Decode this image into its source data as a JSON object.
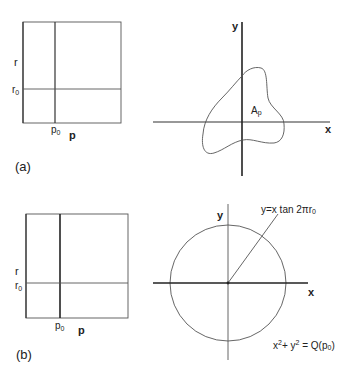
{
  "panel_a": {
    "caption": "(a)",
    "left_plot": {
      "y_label": "r",
      "y_marker": "r",
      "y_marker_sub": "0",
      "x_label": "p",
      "x_marker": "p",
      "x_marker_sub": "0"
    },
    "right_plot": {
      "x_axis_label": "x",
      "y_axis_label": "y",
      "region_label": "A",
      "region_label_sub": "p"
    }
  },
  "panel_b": {
    "caption": "(b)",
    "left_plot": {
      "y_label": "r",
      "y_marker": "r",
      "y_marker_sub": "0",
      "x_label": "p",
      "x_marker": "p",
      "x_marker_sub": "0"
    },
    "right_plot": {
      "x_axis_label": "x",
      "y_axis_label": "y",
      "line_equation": "y=x tan 2πr",
      "line_equation_sub": "0",
      "circle_equation_x": "x",
      "circle_equation_x_sup": "2",
      "circle_equation_plus": "+ y",
      "circle_equation_y_sup": "2",
      "circle_equation_rhs": " = Q(p",
      "circle_equation_rhs_sub": "0",
      "circle_equation_close": ")"
    }
  },
  "colors": {
    "line": "#333333",
    "text": "#222222",
    "background": "#ffffff"
  }
}
